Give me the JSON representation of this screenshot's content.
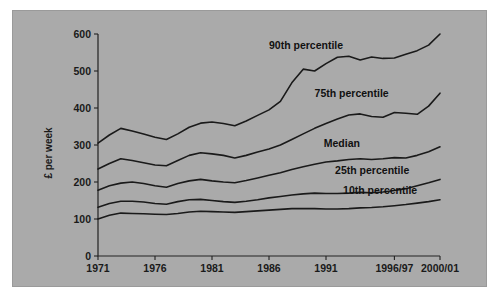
{
  "chart_data": {
    "type": "line",
    "title": "",
    "xlabel": "",
    "ylabel": "£ per week",
    "ylim": [
      0,
      600
    ],
    "yticks": [
      0,
      100,
      200,
      300,
      400,
      500,
      600
    ],
    "ytick_labels": [
      "0",
      "100",
      "200",
      "300",
      "400",
      "500",
      "600"
    ],
    "xlim": [
      1971,
      2001
    ],
    "xticks": [
      1971,
      1976,
      1981,
      1986,
      1991,
      1997,
      2001
    ],
    "xtick_labels": [
      "1971",
      "1976",
      "1981",
      "1986",
      "1991",
      "1996/97",
      "2000/01"
    ],
    "grid": false,
    "legend_position": "inline-labels",
    "x": [
      1971,
      1972,
      1973,
      1974,
      1975,
      1976,
      1977,
      1978,
      1979,
      1980,
      1981,
      1982,
      1983,
      1984,
      1985,
      1986,
      1987,
      1988,
      1989,
      1990,
      1991,
      1992,
      1993,
      1994,
      1995,
      1996,
      1997,
      1998,
      1999,
      2000,
      2001
    ],
    "series": [
      {
        "name": "90th percentile",
        "label": "90th percentile",
        "values": [
          305,
          327,
          345,
          338,
          330,
          321,
          315,
          330,
          348,
          359,
          362,
          358,
          352,
          365,
          380,
          395,
          418,
          468,
          505,
          500,
          520,
          537,
          540,
          530,
          538,
          534,
          535,
          545,
          555,
          570,
          600
        ]
      },
      {
        "name": "75th percentile",
        "label": "75th percentile",
        "values": [
          235,
          250,
          263,
          258,
          252,
          246,
          244,
          258,
          272,
          279,
          276,
          272,
          265,
          272,
          281,
          289,
          300,
          315,
          330,
          345,
          358,
          370,
          381,
          384,
          377,
          375,
          388,
          386,
          383,
          405,
          440
        ]
      },
      {
        "name": "Median",
        "label": "Median",
        "values": [
          178,
          190,
          197,
          200,
          196,
          190,
          186,
          196,
          203,
          207,
          203,
          200,
          198,
          204,
          211,
          218,
          225,
          234,
          241,
          248,
          254,
          257,
          261,
          263,
          261,
          263,
          266,
          265,
          272,
          282,
          295
        ]
      },
      {
        "name": "25th percentile",
        "label": "25th percentile",
        "values": [
          132,
          142,
          148,
          148,
          146,
          142,
          140,
          147,
          152,
          153,
          150,
          147,
          145,
          148,
          152,
          157,
          161,
          165,
          168,
          170,
          169,
          169,
          170,
          172,
          171,
          173,
          177,
          182,
          190,
          198,
          207
        ]
      },
      {
        "name": "10th percentile",
        "label": "10th percentile",
        "values": [
          100,
          110,
          116,
          115,
          114,
          113,
          112,
          115,
          119,
          121,
          120,
          119,
          118,
          120,
          122,
          124,
          126,
          128,
          128,
          128,
          127,
          127,
          128,
          130,
          131,
          133,
          136,
          139,
          143,
          147,
          152
        ]
      }
    ],
    "annotations": [
      {
        "text": "90th percentile",
        "x": 1986.0,
        "y": 560
      },
      {
        "text": "75th percentile",
        "x": 1990.0,
        "y": 430
      },
      {
        "text": "Median",
        "x": 1990.8,
        "y": 295
      },
      {
        "text": "25th percentile",
        "x": 1991.8,
        "y": 222
      },
      {
        "text": "10th percentile",
        "x": 1992.5,
        "y": 168
      }
    ],
    "colors": {
      "background": "#aaaaaa",
      "page": "#ffffff",
      "line": "#1a1a1a",
      "text": "#1a1a1a"
    }
  }
}
